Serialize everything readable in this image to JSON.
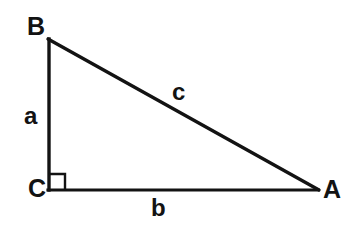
{
  "figure": {
    "background_color": "#ffffff",
    "stroke_color": "#131313",
    "width": 356,
    "height": 237
  },
  "vertices": {
    "B": {
      "label": "B",
      "x": 48,
      "y": 39
    },
    "C": {
      "label": "C",
      "x": 48,
      "y": 190
    },
    "A": {
      "label": "A",
      "x": 318,
      "y": 190
    }
  },
  "sides": {
    "a": {
      "label": "a",
      "from": "B",
      "to": "C",
      "role": "vertical-leg"
    },
    "b": {
      "label": "b",
      "from": "C",
      "to": "A",
      "role": "horizontal-leg"
    },
    "c": {
      "label": "c",
      "from": "B",
      "to": "A",
      "role": "hypotenuse"
    }
  },
  "right_angle": {
    "at_vertex": "C",
    "marker": "square",
    "size": 16
  }
}
